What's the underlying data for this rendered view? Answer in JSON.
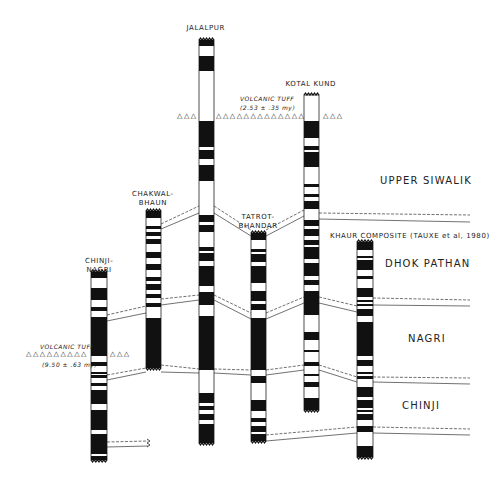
{
  "diagram": {
    "colors": {
      "normal": "#111111",
      "reversed": "#ffffff",
      "line": "#333333",
      "background": "#ffffff"
    }
  },
  "sections": [
    {
      "id": "chinji-nagri",
      "label_line1": "CHINJI-",
      "label_line2": "NAGRI",
      "x": 91,
      "w": 16,
      "top": 272,
      "bottom": 460,
      "label_x": 99,
      "label_y": 257,
      "bands": [
        [
          272,
          278
        ],
        [
          288,
          300
        ],
        [
          307,
          311
        ],
        [
          317,
          356
        ],
        [
          362,
          366
        ],
        [
          372,
          374
        ],
        [
          375,
          378
        ],
        [
          383,
          386
        ],
        [
          390,
          404
        ],
        [
          410,
          430
        ],
        [
          434,
          454
        ],
        [
          456,
          460
        ]
      ]
    },
    {
      "id": "chakwal-bhaun",
      "label_line1": "CHAKWAL-",
      "label_line2": "BHAUN",
      "x": 146,
      "w": 15,
      "top": 211,
      "bottom": 368,
      "label_x": 153,
      "label_y": 190,
      "bands": [
        [
          211,
          218
        ],
        [
          226,
          229
        ],
        [
          232,
          236
        ],
        [
          239,
          244
        ],
        [
          252,
          258
        ],
        [
          264,
          270
        ],
        [
          277,
          281
        ],
        [
          284,
          290
        ],
        [
          294,
          298
        ],
        [
          303,
          307
        ],
        [
          318,
          368
        ]
      ]
    },
    {
      "id": "jalalpur",
      "label_line1": "JALALPUR",
      "label_line2": "",
      "x": 199,
      "w": 15,
      "top": 40,
      "bottom": 443,
      "label_x": 206,
      "label_y": 24,
      "bands": [
        [
          40,
          46
        ],
        [
          56,
          71
        ],
        [
          121,
          147
        ],
        [
          150,
          159
        ],
        [
          165,
          181
        ],
        [
          215,
          222
        ],
        [
          225,
          232
        ],
        [
          247,
          251
        ],
        [
          253,
          261
        ],
        [
          266,
          286
        ],
        [
          292,
          305
        ],
        [
          316,
          370
        ],
        [
          393,
          403
        ],
        [
          406,
          410
        ],
        [
          414,
          420
        ],
        [
          424,
          443
        ]
      ]
    },
    {
      "id": "tatrot-bhandar",
      "label_line1": "TATROT-",
      "label_line2": "BHANDAR",
      "x": 251,
      "w": 15,
      "top": 233,
      "bottom": 441,
      "label_x": 258,
      "label_y": 213,
      "bands": [
        [
          233,
          240
        ],
        [
          249,
          252
        ],
        [
          254,
          262
        ],
        [
          266,
          283
        ],
        [
          291,
          301
        ],
        [
          304,
          310
        ],
        [
          318,
          370
        ],
        [
          376,
          383
        ],
        [
          400,
          411
        ],
        [
          418,
          422
        ],
        [
          426,
          432
        ],
        [
          434,
          441
        ]
      ]
    },
    {
      "id": "kotal-kund",
      "label_line1": "KOTAL KUND",
      "label_line2": "",
      "x": 304,
      "w": 15,
      "top": 95,
      "bottom": 410,
      "label_x": 311,
      "label_y": 80,
      "bands": [
        [
          121,
          138
        ],
        [
          146,
          150
        ],
        [
          152,
          167
        ],
        [
          184,
          187
        ],
        [
          194,
          197
        ],
        [
          201,
          209
        ],
        [
          220,
          226
        ],
        [
          229,
          236
        ],
        [
          240,
          245
        ],
        [
          247,
          259
        ],
        [
          263,
          276
        ],
        [
          280,
          285
        ],
        [
          291,
          315
        ],
        [
          332,
          340
        ],
        [
          350,
          352
        ],
        [
          362,
          366
        ],
        [
          374,
          376
        ],
        [
          382,
          387
        ],
        [
          398,
          410
        ]
      ]
    },
    {
      "id": "khaur-composite",
      "label_line1": "KHAUR COMPOSITE  (TAUXE et al, 1980)",
      "label_line2": "",
      "x": 357,
      "w": 16,
      "top": 242,
      "bottom": 457,
      "label_x": 410,
      "label_y": 232,
      "bands": [
        [
          242,
          250
        ],
        [
          256,
          258
        ],
        [
          260,
          270
        ],
        [
          276,
          279
        ],
        [
          288,
          297
        ],
        [
          300,
          302
        ],
        [
          304,
          306
        ],
        [
          309,
          316
        ],
        [
          322,
          356
        ],
        [
          360,
          366
        ],
        [
          372,
          374
        ],
        [
          376,
          379
        ],
        [
          387,
          397
        ],
        [
          400,
          408
        ],
        [
          410,
          412
        ],
        [
          414,
          420
        ],
        [
          426,
          432
        ],
        [
          446,
          457
        ]
      ]
    }
  ],
  "formations": [
    {
      "id": "upper-siwalik",
      "label": "UPPER SIWALIK",
      "x": 380,
      "y": 175
    },
    {
      "id": "dhok-pathan",
      "label": "DHOK PATHAN",
      "x": 385,
      "y": 258
    },
    {
      "id": "nagri",
      "label": "NAGRI",
      "x": 408,
      "y": 333
    },
    {
      "id": "chinji",
      "label": "CHINJI",
      "x": 402,
      "y": 400
    }
  ],
  "volcanic_tuffs": [
    {
      "id": "upper-tuff",
      "label": "VOLCANIC TUFF",
      "age": "(2.53 ± .35 my)",
      "label_x": 240,
      "label_y": 94,
      "age_x": 240,
      "age_y": 103,
      "triangle_rows": [
        {
          "x": 177,
          "y": 112,
          "text": "△△△"
        },
        {
          "x": 216,
          "y": 112,
          "text": "△△△△△△△△△△△△△"
        },
        {
          "x": 323,
          "y": 112,
          "text": "△△△"
        }
      ]
    },
    {
      "id": "lower-tuff",
      "label": "VOLCANIC TUFF",
      "age": "(9.50 ± .63 my)",
      "label_x": 40,
      "label_y": 342,
      "age_x": 42,
      "age_y": 360,
      "triangle_rows": [
        {
          "x": 26,
          "y": 350,
          "text": "△△△△△△△△△"
        },
        {
          "x": 110,
          "y": 350,
          "text": "△△△"
        }
      ]
    }
  ],
  "correlation_lines": [
    [
      161,
      224,
      199,
      206
    ],
    [
      161,
      229,
      199,
      213
    ],
    [
      214,
      206,
      251,
      230
    ],
    [
      214,
      213,
      251,
      236
    ],
    [
      266,
      230,
      304,
      210
    ],
    [
      266,
      236,
      304,
      216
    ],
    [
      319,
      213,
      470,
      215
    ],
    [
      319,
      219,
      470,
      222
    ],
    [
      107,
      315,
      146,
      306
    ],
    [
      107,
      321,
      146,
      313
    ],
    [
      161,
      299,
      199,
      295
    ],
    [
      161,
      305,
      199,
      300
    ],
    [
      214,
      295,
      251,
      313
    ],
    [
      214,
      300,
      251,
      319
    ],
    [
      266,
      313,
      304,
      297
    ],
    [
      266,
      319,
      304,
      303
    ],
    [
      319,
      297,
      357,
      306
    ],
    [
      319,
      303,
      357,
      312
    ],
    [
      373,
      298,
      470,
      300
    ],
    [
      373,
      305,
      470,
      306
    ],
    [
      107,
      375,
      146,
      368
    ],
    [
      107,
      380,
      146,
      372
    ],
    [
      161,
      365,
      199,
      369
    ],
    [
      161,
      372,
      199,
      373
    ],
    [
      214,
      369,
      251,
      370
    ],
    [
      214,
      373,
      251,
      375
    ],
    [
      266,
      370,
      304,
      365
    ],
    [
      266,
      375,
      304,
      370
    ],
    [
      319,
      365,
      357,
      377
    ],
    [
      319,
      370,
      357,
      382
    ],
    [
      373,
      377,
      470,
      378
    ],
    [
      373,
      382,
      470,
      384
    ],
    [
      107,
      442,
      148,
      441
    ],
    [
      107,
      447,
      148,
      446
    ],
    [
      266,
      435,
      357,
      427
    ],
    [
      266,
      441,
      357,
      433
    ],
    [
      373,
      427,
      470,
      429
    ],
    [
      373,
      433,
      470,
      435
    ]
  ]
}
